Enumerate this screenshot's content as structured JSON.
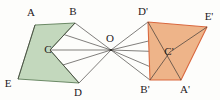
{
  "figure": {
    "background_color": "#fdfdfb",
    "center_label": "O",
    "center_point": {
      "x": 111,
      "y": 50
    },
    "center_label_pos": {
      "x": 110,
      "y": 39
    },
    "source_polygon": {
      "name": "pentagon-abcde",
      "fill_color": "#c3d8bd",
      "stroke_color": "#5d7e58",
      "vertices": [
        {
          "label": "A",
          "x": 35,
          "y": 25,
          "label_x": 31,
          "label_y": 13
        },
        {
          "label": "B",
          "x": 75,
          "y": 23,
          "label_x": 73,
          "label_y": 12
        },
        {
          "label": "C",
          "x": 50,
          "y": 50,
          "label_x": 48,
          "label_y": 50
        },
        {
          "label": "D",
          "x": 79,
          "y": 83,
          "label_x": 78,
          "label_y": 93
        },
        {
          "label": "E",
          "x": 18,
          "y": 79,
          "label_x": 8,
          "label_y": 84
        }
      ],
      "outline_order": [
        "A",
        "B",
        "C",
        "D",
        "E"
      ]
    },
    "image_polygon": {
      "name": "pentagon-a-b-c-d-e-prime",
      "fill_color": "#eeb489",
      "stroke_color": "#d9683f",
      "vertices": [
        {
          "label": "D'",
          "x": 148,
          "y": 22,
          "label_x": 143,
          "label_y": 12
        },
        {
          "label": "E'",
          "x": 207,
          "y": 27,
          "label_x": 209,
          "label_y": 17
        },
        {
          "label": "C'",
          "x": 170,
          "y": 52,
          "label_x": 169,
          "label_y": 52
        },
        {
          "label": "A'",
          "x": 181,
          "y": 80,
          "label_x": 185,
          "label_y": 90
        },
        {
          "label": "B'",
          "x": 150,
          "y": 80,
          "label_x": 145,
          "label_y": 90
        }
      ],
      "outline_order": [
        "D'",
        "E'",
        "A'",
        "B'"
      ]
    },
    "rays": [
      {
        "name": "ray-o-a",
        "from": "O",
        "to": "A"
      },
      {
        "name": "ray-o-b",
        "from": "O",
        "to": "B"
      },
      {
        "name": "ray-o-c",
        "from": "O",
        "to": "C"
      },
      {
        "name": "ray-o-d",
        "from": "O",
        "to": "D"
      },
      {
        "name": "ray-o-e",
        "from": "O",
        "to": "E"
      },
      {
        "name": "ray-o-a-prime",
        "from": "O",
        "to": "A'"
      },
      {
        "name": "ray-o-b-prime",
        "from": "O",
        "to": "B'"
      },
      {
        "name": "ray-o-c-prime",
        "from": "O",
        "to": "C'"
      },
      {
        "name": "ray-o-d-prime",
        "from": "O",
        "to": "D'"
      },
      {
        "name": "ray-o-e-prime",
        "from": "O",
        "to": "E'"
      }
    ],
    "chords": [
      {
        "name": "chord-b-c",
        "from": "B",
        "to": "C"
      },
      {
        "name": "chord-c-d",
        "from": "C",
        "to": "D"
      },
      {
        "name": "chord-a-e",
        "from": "A",
        "to": "E"
      },
      {
        "name": "chord-e-prime-c-prime",
        "from": "E'",
        "to": "C'"
      },
      {
        "name": "chord-c-prime-b-prime",
        "from": "C'",
        "to": "B'"
      },
      {
        "name": "chord-d-prime-a-prime",
        "from": "D'",
        "to": "A'"
      }
    ]
  }
}
